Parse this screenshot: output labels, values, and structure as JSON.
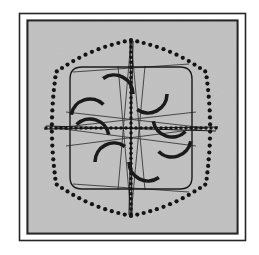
{
  "figure": {
    "canvas": {
      "width": 259,
      "height": 255
    },
    "colors": {
      "page_background": "#ffffff",
      "field_background": "#c1c1c1",
      "ink": "#1a1a1a",
      "frame_stroke": "#262626",
      "thin_line": "#3a3a3a",
      "dot": "#141414"
    },
    "frame": {
      "outer_rect": {
        "x": 19.5,
        "y": 13.5,
        "width": 226,
        "height": 227,
        "stroke_width": 1.6
      },
      "inner_rect": {
        "x": 27.5,
        "y": 20.5,
        "width": 210,
        "height": 213,
        "stroke_width": 2.2
      }
    },
    "field": {
      "x": 29,
      "y": 22,
      "width": 207,
      "height": 210
    },
    "center": {
      "x": 131,
      "y": 128
    },
    "dotted_outline": {
      "shape": "hexagonal-circle",
      "radius_x": 84,
      "radius_y": 88,
      "dot_count": 82,
      "dot_radius": 2.1,
      "vertices": [
        {
          "label": "top",
          "x": 131,
          "y": 40
        },
        {
          "label": "upper-right",
          "x": 206,
          "y": 72
        },
        {
          "label": "lower-right",
          "x": 206,
          "y": 184
        },
        {
          "label": "bottom",
          "x": 131,
          "y": 216
        },
        {
          "label": "lower-left",
          "x": 56,
          "y": 184
        },
        {
          "label": "upper-left",
          "x": 56,
          "y": 72
        }
      ]
    },
    "rounded_square": {
      "x": 70,
      "y": 67,
      "width": 122,
      "height": 122,
      "corner_radius": 12,
      "stroke_width": 1.4
    },
    "dotted_cross": {
      "vertical": {
        "x": 131,
        "y1": 42,
        "y2": 214,
        "dot_count": 34
      },
      "horizontal": {
        "y": 128,
        "x1": 46,
        "x2": 216,
        "dot_count": 34
      },
      "dot_radius": 1.7
    },
    "axis_lines": [
      {
        "name": "horizontal-axis",
        "x1": 44,
        "y1": 129,
        "x2": 218,
        "y2": 127
      },
      {
        "name": "horizontal-axis-secondary",
        "x1": 46,
        "y1": 126,
        "x2": 216,
        "y2": 131
      },
      {
        "name": "vertical-axis",
        "x1": 130,
        "y1": 40,
        "x2": 132,
        "y2": 216
      },
      {
        "name": "vertical-axis-secondary",
        "x1": 133,
        "y1": 41,
        "x2": 129,
        "y2": 215
      }
    ],
    "converging_lines": [
      {
        "from": "top-vertex",
        "x1": 131,
        "y1": 40,
        "x2": 118,
        "y2": 190
      },
      {
        "from": "top-vertex",
        "x1": 131,
        "y1": 40,
        "x2": 145,
        "y2": 190
      },
      {
        "from": "bottom-vertex",
        "x1": 131,
        "y1": 216,
        "x2": 118,
        "y2": 66
      },
      {
        "from": "bottom-vertex",
        "x1": 131,
        "y1": 216,
        "x2": 145,
        "y2": 66
      },
      {
        "from": "left-vertex",
        "x1": 56,
        "y1": 128,
        "x2": 196,
        "y2": 112
      },
      {
        "from": "left-vertex",
        "x1": 56,
        "y1": 128,
        "x2": 196,
        "y2": 146
      },
      {
        "from": "right-vertex",
        "x1": 206,
        "y1": 128,
        "x2": 66,
        "y2": 112
      },
      {
        "from": "right-vertex",
        "x1": 206,
        "y1": 128,
        "x2": 66,
        "y2": 146
      },
      {
        "from": "top-chord-left",
        "x1": 73,
        "y1": 72,
        "x2": 189,
        "y2": 64
      },
      {
        "from": "bottom-chord-left",
        "x1": 73,
        "y1": 184,
        "x2": 189,
        "y2": 192
      }
    ],
    "arcs": {
      "stroke_width": 3.6,
      "radius": 19,
      "items": [
        {
          "name": "arc-q1-inner",
          "quadrant": "top-right",
          "cx": 148,
          "cy": 94,
          "start_deg": 90,
          "end_deg": 215,
          "opens": "down-left"
        },
        {
          "name": "arc-q1-outer",
          "quadrant": "top-right",
          "cx": 172,
          "cy": 118,
          "start_deg": 135,
          "end_deg": 260,
          "opens": "left-up"
        },
        {
          "name": "arc-q2-inner",
          "quadrant": "top-left",
          "cx": 114,
          "cy": 94,
          "start_deg": 325,
          "end_deg": 450,
          "opens": "down-right"
        },
        {
          "name": "arc-q2-outer",
          "quadrant": "top-left",
          "cx": 90,
          "cy": 118,
          "start_deg": 280,
          "end_deg": 405,
          "opens": "right-up"
        },
        {
          "name": "arc-q3-inner",
          "quadrant": "bottom-left",
          "cx": 114,
          "cy": 162,
          "start_deg": 270,
          "end_deg": 395,
          "opens": "up-right"
        },
        {
          "name": "arc-q3-outer",
          "quadrant": "bottom-left",
          "cx": 90,
          "cy": 138,
          "start_deg": 315,
          "end_deg": 440,
          "opens": "right-down"
        },
        {
          "name": "arc-q4-inner",
          "quadrant": "bottom-right",
          "cx": 148,
          "cy": 162,
          "start_deg": 145,
          "end_deg": 270,
          "opens": "up-left"
        },
        {
          "name": "arc-q4-outer",
          "quadrant": "bottom-right",
          "cx": 172,
          "cy": 138,
          "start_deg": 100,
          "end_deg": 225,
          "opens": "left-down"
        }
      ]
    }
  }
}
